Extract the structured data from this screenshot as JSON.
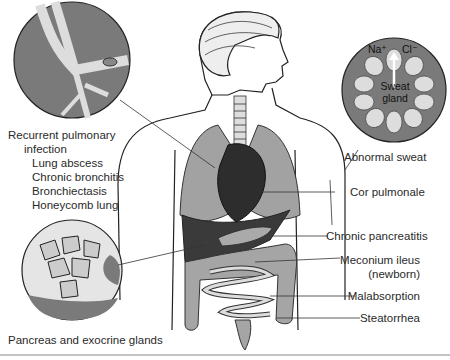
{
  "figure": {
    "labels": {
      "pulmonary_heading": "Recurrent pulmonary",
      "pulmonary_heading2": "infection",
      "pulmonary_items": [
        "Lung abscess",
        "Chronic bronchitis",
        "Bronchiectasis",
        "Honeycomb lung"
      ],
      "pancreas_glands": "Pancreas and exocrine glands",
      "abnormal_sweat": "Abnormal sweat",
      "cor_pulmonale": "Cor pulmonale",
      "chronic_pancreatitis": "Chronic pancreatitis",
      "meconium_ileus": "Meconium ileus",
      "meconium_ileus_note": "(newborn)",
      "malabsorption": "Malabsorption",
      "steatorrhea": "Steatorrhea"
    },
    "sweat_gland": {
      "na": "Na⁺",
      "cl": "Cl⁻",
      "label1": "Sweat",
      "label2": "gland"
    },
    "colors": {
      "circle_fill": "#7a7a7a",
      "organ_gray": "#9a9a9a",
      "dark_organ": "#3a3a3a",
      "cell_fill": "#dcdcdc"
    }
  }
}
